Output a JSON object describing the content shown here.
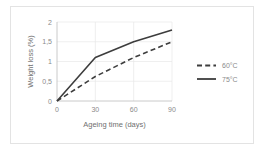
{
  "chart_data": {
    "type": "line",
    "title": "",
    "xlabel": "Ageing time (days)",
    "ylabel": "Weight loss (%)",
    "x": [
      0,
      30,
      60,
      90
    ],
    "xlim": [
      0,
      90
    ],
    "ylim": [
      0,
      2
    ],
    "xticks": [
      "0",
      "30",
      "60",
      "90"
    ],
    "yticks": [
      "0",
      "0,5",
      "1",
      "1,5",
      "2"
    ],
    "xtick_values": [
      0,
      30,
      60,
      90
    ],
    "ytick_values": [
      0,
      0.5,
      1,
      1.5,
      2
    ],
    "grid": true,
    "legend_position": "right",
    "series": [
      {
        "name": "60°C",
        "style": "dashed",
        "color": "#3d3d3d",
        "values": [
          0,
          0.62,
          1.1,
          1.5
        ]
      },
      {
        "name": "75°C",
        "style": "solid",
        "color": "#3d3d3d",
        "values": [
          0,
          1.1,
          1.5,
          1.8
        ]
      }
    ]
  },
  "legend": {
    "items": [
      {
        "label": "60°C",
        "style": "dashed"
      },
      {
        "label": "75°C",
        "style": "solid"
      }
    ]
  },
  "colors": {
    "line": "#3d3d3d",
    "grid": "#e8e8e8",
    "axis": "#bdbdbd",
    "text": "#8a8a8a",
    "border": "#e3e3e3",
    "background": "#ffffff"
  }
}
